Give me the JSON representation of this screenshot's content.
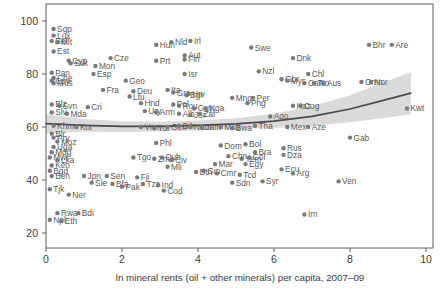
{
  "figure_title": "",
  "colors": {
    "dot": "#7a7a7a",
    "point_label": "#5a5a5a",
    "trend_line": "#4a4a4a",
    "confidence_band": "#d6d6d6",
    "axis": "#5f5f5f",
    "tick_text": "#3d3d3d",
    "background": "#ffffff"
  },
  "chart_data": {
    "type": "scatter",
    "title": "",
    "xlabel": "ln mineral rents (oil + other minerals) per capita, 2007–09",
    "ylabel": "",
    "xlim": [
      0,
      10
    ],
    "ylim": [
      20,
      100
    ],
    "x_ticks": [
      0,
      2,
      4,
      6,
      8,
      10
    ],
    "y_ticks": [
      20,
      40,
      60,
      80,
      100
    ],
    "grid": false,
    "legend": "none",
    "points": [
      {
        "label": "Sgp",
        "x": 0.2,
        "y": 97
      },
      {
        "label": "Lux",
        "x": 0.2,
        "y": 94.5
      },
      {
        "label": "Bel",
        "x": 0.15,
        "y": 92.5
      },
      {
        "label": "Mlt",
        "x": 0.3,
        "y": 92
      },
      {
        "label": "Est",
        "x": 0.2,
        "y": 88.5
      },
      {
        "label": "Pan",
        "x": 0.15,
        "y": 80.5
      },
      {
        "label": "Che",
        "x": 0.2,
        "y": 78.5
      },
      {
        "label": "Cpv",
        "x": 0.15,
        "y": 77.5
      },
      {
        "label": "Mus",
        "x": 0.2,
        "y": 76.5
      },
      {
        "label": "Blz",
        "x": 0.15,
        "y": 68.5
      },
      {
        "label": "Svn",
        "x": 0.35,
        "y": 68
      },
      {
        "label": "Slv",
        "x": 0.15,
        "y": 65.5
      },
      {
        "label": "Mda",
        "x": 0.55,
        "y": 65
      },
      {
        "label": "Khm",
        "x": 0.2,
        "y": 60.5
      },
      {
        "label": "Kor",
        "x": 0.8,
        "y": 60
      },
      {
        "label": "Blr",
        "x": 0.15,
        "y": 57.5
      },
      {
        "label": "Pry",
        "x": 0.2,
        "y": 56
      },
      {
        "label": "Moz",
        "x": 0.3,
        "y": 54.5
      },
      {
        "label": "Uga",
        "x": 0.2,
        "y": 52.5
      },
      {
        "label": "Mdg",
        "x": 0.15,
        "y": 50.5
      },
      {
        "label": "Mwi",
        "x": 0.1,
        "y": 48.5
      },
      {
        "label": "Lka",
        "x": 0.3,
        "y": 47.5
      },
      {
        "label": "Ken",
        "x": 0.15,
        "y": 45.5
      },
      {
        "label": "Bgd",
        "x": 0.1,
        "y": 43.5
      },
      {
        "label": "Ben",
        "x": 0.15,
        "y": 41.5
      },
      {
        "label": "Tjk",
        "x": 0.1,
        "y": 36.5
      },
      {
        "label": "Ner",
        "x": 0.6,
        "y": 34.5
      },
      {
        "label": "Rwa",
        "x": 0.3,
        "y": 27.5
      },
      {
        "label": "Bdi",
        "x": 0.85,
        "y": 27.5
      },
      {
        "label": "Npl",
        "x": 0.1,
        "y": 25
      },
      {
        "label": "Eth",
        "x": 0.4,
        "y": 24.5
      },
      {
        "label": "Cyp",
        "x": 0.6,
        "y": 85
      },
      {
        "label": "Svk",
        "x": 0.65,
        "y": 84
      },
      {
        "label": "Cze",
        "x": 1.7,
        "y": 86
      },
      {
        "label": "Mon",
        "x": 1.3,
        "y": 83
      },
      {
        "label": "Esp",
        "x": 1.25,
        "y": 80
      },
      {
        "label": "Fra",
        "x": 1.5,
        "y": 74
      },
      {
        "label": "Cri",
        "x": 1.1,
        "y": 67.5
      },
      {
        "label": "Jpn",
        "x": 1.0,
        "y": 41.5
      },
      {
        "label": "Sen",
        "x": 1.6,
        "y": 41.5
      },
      {
        "label": "Sle",
        "x": 1.2,
        "y": 39
      },
      {
        "label": "Bfa",
        "x": 1.75,
        "y": 38.5
      },
      {
        "label": "Pak",
        "x": 2.0,
        "y": 37.5
      },
      {
        "label": "Fji",
        "x": 2.4,
        "y": 41
      },
      {
        "label": "Tza",
        "x": 2.55,
        "y": 38.5
      },
      {
        "label": "Ind",
        "x": 2.95,
        "y": 38
      },
      {
        "label": "Geo",
        "x": 2.1,
        "y": 77.5
      },
      {
        "label": "Deu",
        "x": 2.3,
        "y": 73.5
      },
      {
        "label": "Ltu",
        "x": 2.2,
        "y": 71.5
      },
      {
        "label": "Hnd",
        "x": 2.5,
        "y": 69
      },
      {
        "label": "Ury",
        "x": 2.6,
        "y": 66
      },
      {
        "label": "Arm",
        "x": 2.9,
        "y": 65.5
      },
      {
        "label": "Vnm",
        "x": 2.5,
        "y": 60
      },
      {
        "label": "Tur",
        "x": 2.85,
        "y": 59.5
      },
      {
        "label": "Gtm",
        "x": 3.2,
        "y": 60
      },
      {
        "label": "Phl",
        "x": 2.9,
        "y": 54
      },
      {
        "label": "Tgo",
        "x": 2.3,
        "y": 48.5
      },
      {
        "label": "Zmb",
        "x": 2.85,
        "y": 48
      },
      {
        "label": "Cub",
        "x": 3.05,
        "y": 48.5
      },
      {
        "label": "Civ",
        "x": 3.3,
        "y": 47.5
      },
      {
        "label": "Mli",
        "x": 3.2,
        "y": 45
      },
      {
        "label": "Cod",
        "x": 3.1,
        "y": 36
      },
      {
        "label": "Hun",
        "x": 2.9,
        "y": 91
      },
      {
        "label": "Nld",
        "x": 3.3,
        "y": 92
      },
      {
        "label": "Irl",
        "x": 3.8,
        "y": 92.5
      },
      {
        "label": "Prt",
        "x": 2.9,
        "y": 85
      },
      {
        "label": "Aut",
        "x": 3.65,
        "y": 87
      },
      {
        "label": "Fin",
        "x": 3.65,
        "y": 85.5
      },
      {
        "label": "Isr",
        "x": 3.65,
        "y": 80
      },
      {
        "label": "Ita",
        "x": 3.2,
        "y": 74
      },
      {
        "label": "Grc",
        "x": 3.35,
        "y": 73
      },
      {
        "label": "Hrv",
        "x": 3.75,
        "y": 72.5
      },
      {
        "label": "Bgr",
        "x": 3.7,
        "y": 72
      },
      {
        "label": "Pol",
        "x": 3.35,
        "y": 68.5
      },
      {
        "label": "Rou",
        "x": 3.5,
        "y": 68
      },
      {
        "label": "Alb",
        "x": 3.5,
        "y": 65
      },
      {
        "label": "Jor",
        "x": 3.8,
        "y": 64.5
      },
      {
        "label": "Zaf",
        "x": 4.05,
        "y": 65
      },
      {
        "label": "Guy",
        "x": 3.9,
        "y": 67
      },
      {
        "label": "Nga",
        "x": 4.2,
        "y": 67
      },
      {
        "label": "Bih",
        "x": 3.5,
        "y": 60.5
      },
      {
        "label": "Nam",
        "x": 3.8,
        "y": 60
      },
      {
        "label": "Jam",
        "x": 4.1,
        "y": 60
      },
      {
        "label": "Mkd",
        "x": 4.6,
        "y": 60
      },
      {
        "label": "Bwa",
        "x": 4.9,
        "y": 59.5
      },
      {
        "label": "Tha",
        "x": 5.5,
        "y": 60.5
      },
      {
        "label": "Btn",
        "x": 3.95,
        "y": 43
      },
      {
        "label": "Gin",
        "x": 4.15,
        "y": 43.5
      },
      {
        "label": "Cmr",
        "x": 4.5,
        "y": 42.5
      },
      {
        "label": "Mar",
        "x": 4.45,
        "y": 46
      },
      {
        "label": "Chn",
        "x": 4.8,
        "y": 49
      },
      {
        "label": "Dom",
        "x": 4.6,
        "y": 53
      },
      {
        "label": "Bol",
        "x": 5.25,
        "y": 53.5
      },
      {
        "label": "Sdn",
        "x": 4.9,
        "y": 39
      },
      {
        "label": "Tcd",
        "x": 5.1,
        "y": 42
      },
      {
        "label": "Syr",
        "x": 5.7,
        "y": 39.5
      },
      {
        "label": "Yem",
        "x": 5.15,
        "y": 48
      },
      {
        "label": "Col",
        "x": 5.35,
        "y": 48.5
      },
      {
        "label": "Egy",
        "x": 5.25,
        "y": 46
      },
      {
        "label": "Bra",
        "x": 5.5,
        "y": 50.5
      },
      {
        "label": "Swe",
        "x": 5.4,
        "y": 90
      },
      {
        "label": "Nzl",
        "x": 5.6,
        "y": 81
      },
      {
        "label": "Mng",
        "x": 4.9,
        "y": 71
      },
      {
        "label": "Per",
        "x": 5.45,
        "y": 71
      },
      {
        "label": "Png",
        "x": 5.3,
        "y": 69
      },
      {
        "label": "Ago",
        "x": 5.9,
        "y": 64
      },
      {
        "label": "Dnk",
        "x": 6.5,
        "y": 86
      },
      {
        "label": "Chl",
        "x": 6.9,
        "y": 80
      },
      {
        "label": "Gbr",
        "x": 6.2,
        "y": 78
      },
      {
        "label": "Mys",
        "x": 6.35,
        "y": 77.5
      },
      {
        "label": "Can",
        "x": 6.8,
        "y": 76.5
      },
      {
        "label": "Tto",
        "x": 7.05,
        "y": 76.5
      },
      {
        "label": "Aus",
        "x": 7.3,
        "y": 76.5
      },
      {
        "label": "Kaz",
        "x": 6.5,
        "y": 68
      },
      {
        "label": "Cog",
        "x": 6.7,
        "y": 68
      },
      {
        "label": "Mex",
        "x": 6.35,
        "y": 60
      },
      {
        "label": "Aze",
        "x": 6.9,
        "y": 60
      },
      {
        "label": "Rus",
        "x": 6.25,
        "y": 52
      },
      {
        "label": "Dza",
        "x": 6.25,
        "y": 49.5
      },
      {
        "label": "Ecu",
        "x": 6.2,
        "y": 44
      },
      {
        "label": "Arg",
        "x": 6.5,
        "y": 42.5
      },
      {
        "label": "Irn",
        "x": 6.8,
        "y": 27
      },
      {
        "label": "Ven",
        "x": 7.7,
        "y": 39.5
      },
      {
        "label": "Gab",
        "x": 8.0,
        "y": 56
      },
      {
        "label": "Omn",
        "x": 8.3,
        "y": 77
      },
      {
        "label": "Nor",
        "x": 8.55,
        "y": 77
      },
      {
        "label": "Bhr",
        "x": 8.5,
        "y": 91
      },
      {
        "label": "Are",
        "x": 9.1,
        "y": 91
      },
      {
        "label": "Kwt",
        "x": 9.5,
        "y": 67
      }
    ],
    "trend": {
      "x": [
        0,
        1,
        2,
        3,
        4,
        5,
        6,
        7,
        8,
        9,
        9.6
      ],
      "y": [
        61.3,
        60.6,
        60.2,
        60.2,
        60.6,
        61.2,
        62.2,
        64.0,
        66.8,
        70.5,
        72.8
      ],
      "band_upper": [
        64.8,
        63.0,
        62.2,
        62.0,
        62.5,
        63.3,
        65.0,
        67.8,
        72.0,
        77.5,
        80.8
      ],
      "band_lower": [
        57.6,
        58.2,
        58.1,
        58.3,
        58.7,
        59.2,
        59.6,
        60.4,
        61.8,
        63.6,
        64.8
      ]
    }
  }
}
